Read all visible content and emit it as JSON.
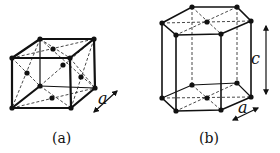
{
  "figure": {
    "panels": [
      {
        "id": "a",
        "caption": "(a)",
        "structure": "body-centered-cubic-like cube with face atoms",
        "arrow_labels": [
          "a"
        ]
      },
      {
        "id": "b",
        "caption": "(b)",
        "structure": "hexagonal prism",
        "arrow_labels": [
          "c",
          "a"
        ]
      }
    ],
    "labels": {
      "a_panel_caption": "(a)",
      "b_panel_caption": "(b)",
      "a_lattice_param": "a",
      "b_lattice_param_c": "c",
      "b_lattice_param_a": "a"
    },
    "colors": {
      "line": "#111111",
      "background": "#ffffff"
    }
  }
}
